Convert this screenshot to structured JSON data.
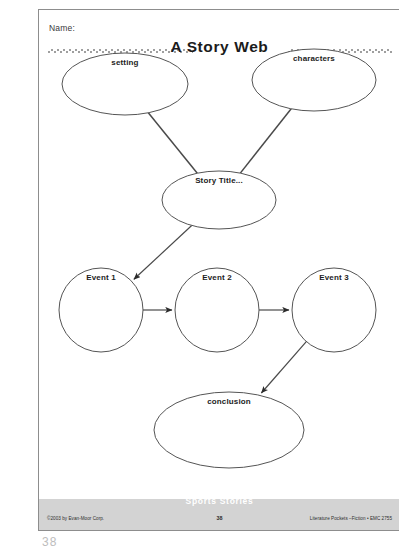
{
  "page": {
    "name_label": "Name:",
    "title": "A Story Web"
  },
  "diagram": {
    "type": "story-web-graphic-organizer",
    "nodes": [
      {
        "id": "setting",
        "label": "setting",
        "shape": "ellipse",
        "cx": 86,
        "cy": 74,
        "rx": 63,
        "ry": 31
      },
      {
        "id": "characters",
        "label": "characters",
        "shape": "ellipse",
        "cx": 275,
        "cy": 70,
        "rx": 62,
        "ry": 31
      },
      {
        "id": "story-title",
        "label": "Story Title...",
        "shape": "ellipse",
        "cx": 180,
        "cy": 190,
        "rx": 57,
        "ry": 29
      },
      {
        "id": "event-1",
        "label": "Event 1",
        "shape": "circle",
        "cx": 62,
        "cy": 300,
        "rx": 42,
        "ry": 42
      },
      {
        "id": "event-2",
        "label": "Event 2",
        "shape": "circle",
        "cx": 178,
        "cy": 300,
        "rx": 42,
        "ry": 42
      },
      {
        "id": "event-3",
        "label": "Event 3",
        "shape": "circle",
        "cx": 295,
        "cy": 300,
        "rx": 42,
        "ry": 42
      },
      {
        "id": "conclusion",
        "label": "conclusion",
        "shape": "ellipse",
        "cx": 190,
        "cy": 420,
        "rx": 75,
        "ry": 38
      }
    ],
    "edges": [
      {
        "from": "setting",
        "to": "story-title",
        "arrow": false
      },
      {
        "from": "characters",
        "to": "story-title",
        "arrow": false
      },
      {
        "from": "story-title",
        "to": "event-1",
        "arrow": true
      },
      {
        "from": "event-1",
        "to": "event-2",
        "arrow": true
      },
      {
        "from": "event-2",
        "to": "event-3",
        "arrow": true
      },
      {
        "from": "event-3",
        "to": "conclusion",
        "arrow": true
      }
    ]
  },
  "footer": {
    "banner": "Sports Stories",
    "copyright": "©2003 by Evan-Moor Corp.",
    "page_number": "38",
    "source": "Literature Pockets –Fiction • EMC 2755"
  },
  "artifact": {
    "marks": "38"
  },
  "colors": {
    "ink": "#1c1c1c",
    "stroke": "#4a4a4a",
    "page_border": "#8d8d8d",
    "footer_band": "#d3d3d3",
    "banner_text": "#ffffff"
  }
}
